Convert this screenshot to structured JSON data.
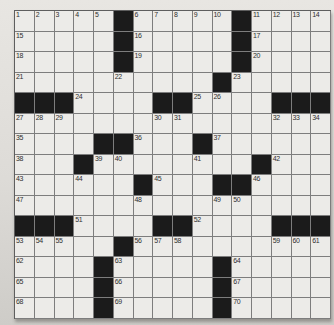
{
  "puzzle": {
    "type": "crossword",
    "rows": 15,
    "columns": 16,
    "black_marker": "#",
    "first_number": "1",
    "last_number": "70",
    "colors": {
      "black_square": "#1b1b1b",
      "white_square": "#ecebe8",
      "grid_line": "#7d7d7d",
      "outer_border": "#5e5e5e",
      "number_text": "#2f2f2f",
      "page_background": "#dddbd7"
    },
    "grid": [
      [
        "1",
        "2",
        "3",
        "4",
        "5",
        "#",
        "6",
        "7",
        "8",
        "9",
        "10",
        "#",
        "11",
        "12",
        "13",
        "14"
      ],
      [
        "15",
        "",
        "",
        "",
        "",
        "#",
        "16",
        "",
        "",
        "",
        "",
        "#",
        "17",
        "",
        "",
        ""
      ],
      [
        "18",
        "",
        "",
        "",
        "",
        "#",
        "19",
        "",
        "",
        "",
        "",
        "#",
        "20",
        "",
        "",
        ""
      ],
      [
        "21",
        "",
        "",
        "",
        "",
        "22",
        "",
        "",
        "",
        "",
        "#",
        "23",
        "",
        "",
        "",
        ""
      ],
      [
        "#",
        "#",
        "#",
        "24",
        "",
        "",
        "",
        "#",
        "#",
        "25",
        "26",
        "",
        "",
        "#",
        "#",
        "#"
      ],
      [
        "27",
        "28",
        "29",
        "",
        "",
        "",
        "",
        "30",
        "31",
        "",
        "",
        "",
        "",
        "32",
        "33",
        "34"
      ],
      [
        "35",
        "",
        "",
        "",
        "#",
        "#",
        "36",
        "",
        "",
        "#",
        "37",
        "",
        "",
        "",
        "",
        ""
      ],
      [
        "38",
        "",
        "",
        "#",
        "39",
        "40",
        "",
        "",
        "",
        "41",
        "",
        "",
        "#",
        "42",
        "",
        ""
      ],
      [
        "43",
        "",
        "",
        "44",
        "",
        "",
        "#",
        "45",
        "",
        "",
        "#",
        "#",
        "46",
        "",
        "",
        ""
      ],
      [
        "47",
        "",
        "",
        "",
        "",
        "",
        "48",
        "",
        "",
        "",
        "49",
        "50",
        "",
        "",
        "",
        ""
      ],
      [
        "#",
        "#",
        "#",
        "51",
        "",
        "",
        "",
        "#",
        "#",
        "52",
        "",
        "",
        "",
        "#",
        "#",
        "#"
      ],
      [
        "53",
        "54",
        "55",
        "",
        "",
        "#",
        "56",
        "57",
        "58",
        "",
        "",
        "",
        "",
        "59",
        "60",
        "61"
      ],
      [
        "62",
        "",
        "",
        "",
        "#",
        "63",
        "",
        "",
        "",
        "",
        "#",
        "64",
        "",
        "",
        "",
        ""
      ],
      [
        "65",
        "",
        "",
        "",
        "#",
        "66",
        "",
        "",
        "",
        "",
        "#",
        "67",
        "",
        "",
        "",
        ""
      ],
      [
        "68",
        "",
        "",
        "",
        "#",
        "69",
        "",
        "",
        "",
        "",
        "#",
        "70",
        "",
        "",
        "",
        ""
      ]
    ]
  }
}
